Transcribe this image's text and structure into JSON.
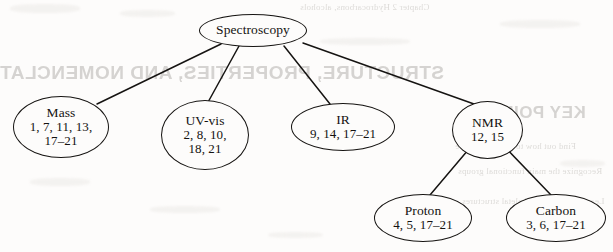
{
  "diagram": {
    "title": "Spectroscopy",
    "type": "tree",
    "root": {
      "id": "spectroscopy",
      "label": "Spectroscopy",
      "refs": []
    },
    "nodes": [
      {
        "id": "spectroscopy",
        "label": "Spectroscopy",
        "refs": [],
        "refs_text": "",
        "parent": null,
        "level": 0
      },
      {
        "id": "mass",
        "label": "Mass",
        "refs": [
          "1, 7, 11, 13,",
          "17–21"
        ],
        "refs_line1": "1, 7, 11, 13,",
        "refs_line2": "17–21",
        "parent": "spectroscopy",
        "level": 1
      },
      {
        "id": "uv-vis",
        "label": "UV-vis",
        "refs": [
          "2, 8, 10,",
          "18, 21"
        ],
        "refs_line1": "2, 8, 10,",
        "refs_line2": "18, 21",
        "parent": "spectroscopy",
        "level": 1
      },
      {
        "id": "ir",
        "label": "IR",
        "refs": [
          "9, 14, 17–21"
        ],
        "refs_line1": "9, 14, 17–21",
        "refs_line2": "",
        "parent": "spectroscopy",
        "level": 1
      },
      {
        "id": "nmr",
        "label": "NMR",
        "refs": [
          "12, 15"
        ],
        "refs_line1": "12, 15",
        "refs_line2": "",
        "parent": "spectroscopy",
        "level": 1
      },
      {
        "id": "proton",
        "label": "Proton",
        "refs": [
          "4, 5, 17–21"
        ],
        "refs_line1": "4, 5, 17–21",
        "refs_line2": "",
        "parent": "nmr",
        "level": 2
      },
      {
        "id": "carbon",
        "label": "Carbon",
        "refs": [
          "3, 6, 17–21"
        ],
        "refs_line1": "3, 6, 17–21",
        "refs_line2": "",
        "parent": "nmr",
        "level": 2
      }
    ],
    "edges": [
      {
        "from": "spectroscopy",
        "to": "mass"
      },
      {
        "from": "spectroscopy",
        "to": "uv-vis"
      },
      {
        "from": "spectroscopy",
        "to": "ir"
      },
      {
        "from": "spectroscopy",
        "to": "nmr"
      },
      {
        "from": "nmr",
        "to": "proton"
      },
      {
        "from": "nmr",
        "to": "carbon"
      }
    ],
    "colors": {
      "stroke": "#161412",
      "text": "#141210",
      "paper": "#fdfcfb",
      "bleed": "#cfcdca"
    }
  },
  "bleedthrough": {
    "heading": "STRUCTURE, PROPERTIES, AND NOMENCLATURE",
    "keypoints": "KEY POINTS",
    "top_line": "Chapter 2  Hydrocarbons, alcohols",
    "bullets": [
      "Find out how to build and name",
      "Recognize the main functional groups",
      "Learn how to draw skeletal structures"
    ]
  }
}
